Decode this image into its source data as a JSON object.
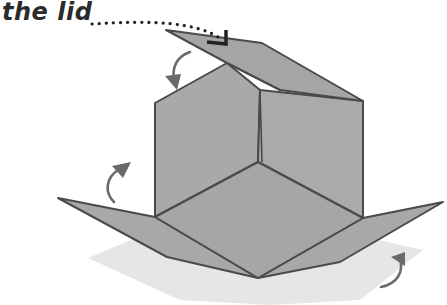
{
  "figure": {
    "label": "the lid",
    "colors": {
      "paper": "#a6a6a6",
      "paper_light": "#b0b0b0",
      "edge": "#4a4a4a",
      "shadow": "#e4e4e4",
      "arrow": "#6a6a6a",
      "leader": "#222222"
    },
    "arrows": [
      {
        "name": "lid-fold-arrow",
        "direction": "down"
      },
      {
        "name": "left-flap-fold-arrow",
        "direction": "up"
      },
      {
        "name": "right-flap-fold-arrow",
        "direction": "up"
      }
    ]
  }
}
